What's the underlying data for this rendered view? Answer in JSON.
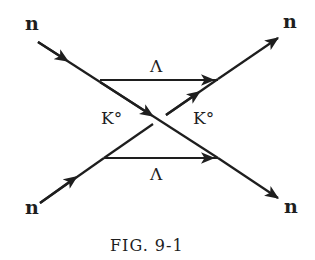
{
  "figure": {
    "caption": "FIG. 9-1",
    "colors": {
      "ink": "#1e1e1e",
      "background": "#ffffff"
    },
    "particles": {
      "incoming_top": "n",
      "incoming_bottom": "n",
      "outgoing_top": "n",
      "outgoing_bottom": "n",
      "exchange_top": "Λ",
      "exchange_bottom": "Λ",
      "meson_left": "K°",
      "meson_right": "K°"
    }
  }
}
